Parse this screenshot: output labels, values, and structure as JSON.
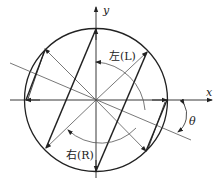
{
  "diagram": {
    "title": "",
    "axes": {
      "x_label": "x",
      "y_label": "y"
    },
    "labels": {
      "left": "左(L)",
      "right": "右(R)",
      "angle": "θ"
    },
    "colors": {
      "line": "#222222",
      "thin_line": "#555555",
      "background": "#ffffff"
    }
  }
}
